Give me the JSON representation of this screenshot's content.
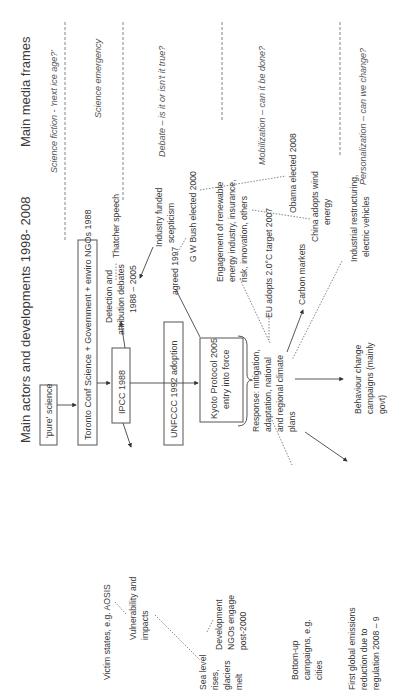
{
  "titles": {
    "media_frames": "Main media frames",
    "actors": "Main actors and developments 1998- 2008"
  },
  "frames": [
    "Science fiction - 'next ice age?'",
    "Science emergency",
    "Debate – is it or isn't it true?",
    "Mobilization – can it be done?",
    "Personalization – can we change?"
  ],
  "boxes": {
    "pure_science": "'pure' science",
    "toronto": "Toronto Conf Science + Government + enviro NGOs 1988",
    "ipcc": "IPCC 1988",
    "unfccc": "UNFCCC 1992 adoption",
    "kyoto": [
      "Kyoto Protocol 2005",
      "entry into force"
    ]
  },
  "labels": {
    "detection": [
      "Detection and",
      "attribution debates",
      "1988 – 2005"
    ],
    "thatcher": "Thatcher speech",
    "industry": [
      "Industry funded",
      "scepticism"
    ],
    "bush": "G W Bush elected 2000",
    "agreed": "agreed 1997",
    "engagement": [
      "Engagement of renewable",
      "energy industry, insurance,",
      "risk, innovation, others"
    ],
    "obama": "Obama elected 2008",
    "china": [
      "China adopts wind",
      "energy"
    ],
    "eu": "EU adopts 2.0°C target 2007",
    "carbon": "Carbon markets",
    "industrial": [
      "Industrial restructuring,",
      "electric vehicles"
    ],
    "response": [
      "Response: mitigation,",
      "adaptation, national",
      "and regional  climate",
      "plans"
    ],
    "behaviour": [
      "Behaviour change",
      "campaigns (mainly",
      "govt)"
    ],
    "victim": "Victim states, e.g. AOSIS",
    "vulnerability": [
      "Vulnerability and",
      "impacts"
    ],
    "sealevel": [
      "Sea level",
      "rises,",
      "glaciers",
      "melt"
    ],
    "development": [
      "Development",
      "NGOs engage",
      "post-2000"
    ],
    "bottomup": [
      "Bottom-up",
      "campaigns, e.g.",
      "cities"
    ],
    "first": [
      "First global emissions",
      "reduction due to",
      "regulation 2008 – 9"
    ]
  }
}
